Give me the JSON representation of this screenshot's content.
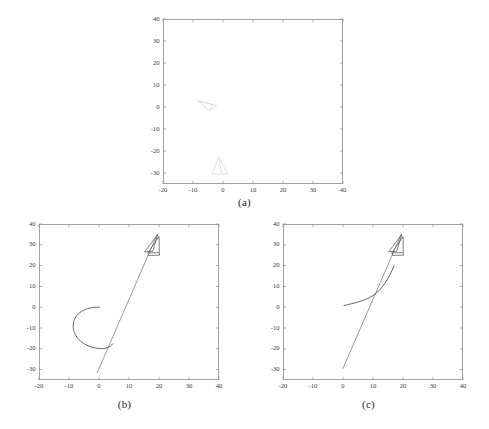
{
  "figure": {
    "panels": [
      {
        "id": "a",
        "caption": "(a)",
        "xlabel": "",
        "ylabel": "",
        "xticks": [
          -20,
          -10,
          0,
          10,
          20,
          30,
          40
        ],
        "yticks": [
          -30,
          -20,
          -10,
          0,
          10,
          20,
          30,
          40
        ],
        "xlim": [
          -20,
          40
        ],
        "ylim": [
          -35,
          40
        ],
        "grid": false,
        "box": true,
        "series": [
          {
            "name": "start-pose-marker",
            "type": "polygon",
            "style": "faint",
            "points": [
              [
                -8.5,
                2.8
              ],
              [
                -2.0,
                0.6
              ],
              [
                -4.4,
                -1.6
              ]
            ]
          },
          {
            "name": "start-pose-marker-inner",
            "type": "polyline",
            "style": "faint",
            "points": [
              [
                -8.5,
                2.8
              ],
              [
                -3.6,
                1.2
              ],
              [
                -4.4,
                -1.6
              ]
            ]
          },
          {
            "name": "goal-pose-marker",
            "type": "polygon",
            "style": "faint",
            "points": [
              [
                -1.5,
                -22.5
              ],
              [
                1.6,
                -30.5
              ],
              [
                -3.6,
                -30.5
              ]
            ]
          },
          {
            "name": "goal-pose-marker-inner",
            "type": "polyline",
            "style": "faint",
            "points": [
              [
                -1.5,
                -22.5
              ],
              [
                -0.4,
                -30.5
              ]
            ]
          }
        ]
      },
      {
        "id": "b",
        "caption": "(b)",
        "xlabel": "",
        "ylabel": "",
        "xticks": [
          -20,
          -10,
          0,
          10,
          20,
          30,
          40
        ],
        "yticks": [
          -30,
          -20,
          -10,
          0,
          10,
          20,
          30,
          40
        ],
        "xlim": [
          -20,
          40
        ],
        "ylim": [
          -35,
          40
        ],
        "grid": false,
        "box": true,
        "series": [
          {
            "name": "straight-path",
            "type": "polyline",
            "style": "line",
            "points": [
              [
                -0.6,
                -31.5
              ],
              [
                19.4,
                35.0
              ]
            ]
          },
          {
            "name": "loop-path",
            "type": "path",
            "style": "curve",
            "d": "M 0.2 0.0 C -4.5 0.3 -8.4 -3.0 -8.6 -8.6 C -8.8 -14.4 -5.0 -19.4 0.4 -19.9 C 2.3 -20.1 3.6 -19.3 4.6 -17.6"
          },
          {
            "name": "robot-triangle-outer",
            "type": "polygon",
            "style": "solid",
            "points": [
              [
                15.2,
                26.6
              ],
              [
                19.6,
                35.0
              ],
              [
                17.9,
                26.9
              ]
            ]
          },
          {
            "name": "robot-triangle-inner",
            "type": "polygon",
            "style": "solid",
            "points": [
              [
                16.3,
                26.1
              ],
              [
                20.0,
                34.0
              ],
              [
                20.1,
                26.2
              ]
            ]
          },
          {
            "name": "robot-base-box",
            "type": "polyline",
            "style": "solid",
            "points": [
              [
                16.3,
                26.1
              ],
              [
                16.5,
                24.9
              ],
              [
                20.2,
                25.0
              ],
              [
                20.1,
                26.2
              ]
            ]
          }
        ]
      },
      {
        "id": "c",
        "caption": "(c)",
        "xlabel": "",
        "ylabel": "",
        "xticks": [
          -20,
          -10,
          0,
          10,
          20,
          30,
          40
        ],
        "yticks": [
          -30,
          -20,
          -10,
          0,
          10,
          20,
          30,
          40
        ],
        "xlim": [
          -20,
          40
        ],
        "ylim": [
          -35,
          40
        ],
        "grid": false,
        "box": true,
        "series": [
          {
            "name": "straight-path",
            "type": "polyline",
            "style": "line",
            "points": [
              [
                0.0,
                -29.4
              ],
              [
                19.4,
                35.0
              ]
            ]
          },
          {
            "name": "smooth-path",
            "type": "path",
            "style": "curve",
            "d": "M 0.3 0.8 C 3.6 1.9 7.2 3.0 10.0 5.6 C 12.9 8.3 15.2 13.6 17.0 19.8"
          },
          {
            "name": "robot-triangle-outer",
            "type": "polygon",
            "style": "solid",
            "points": [
              [
                15.2,
                26.6
              ],
              [
                19.6,
                35.0
              ],
              [
                17.9,
                26.9
              ]
            ]
          },
          {
            "name": "robot-triangle-inner",
            "type": "polygon",
            "style": "solid",
            "points": [
              [
                16.3,
                26.1
              ],
              [
                20.0,
                34.0
              ],
              [
                20.1,
                26.2
              ]
            ]
          },
          {
            "name": "robot-base-box",
            "type": "polyline",
            "style": "solid",
            "points": [
              [
                16.3,
                26.1
              ],
              [
                16.5,
                24.9
              ],
              [
                20.2,
                25.0
              ],
              [
                20.1,
                26.2
              ]
            ]
          }
        ]
      }
    ]
  },
  "chart_data": {
    "type": "line",
    "title": "",
    "subtitle": "",
    "xlabel": "",
    "ylabel": "",
    "xlim": [
      -20,
      40
    ],
    "ylim": [
      -35,
      40
    ],
    "xticks": [
      -20,
      -10,
      0,
      10,
      20,
      30,
      40
    ],
    "yticks": [
      -30,
      -20,
      -10,
      0,
      10,
      20,
      30,
      40
    ],
    "grid": false,
    "legend": "none",
    "panels": [
      {
        "label": "(a)",
        "description": "Initial and goal vehicle poses only; no trajectory drawn",
        "series": [
          {
            "name": "start-pose-marker",
            "x": [
              -8.5,
              -2.0,
              -4.4,
              -8.5
            ],
            "y": [
              2.8,
              0.6,
              -1.6,
              2.8
            ]
          },
          {
            "name": "goal-pose-marker",
            "x": [
              -1.5,
              1.6,
              -3.6,
              -1.5
            ],
            "y": [
              -22.5,
              -30.5,
              -30.5,
              -22.5
            ]
          }
        ]
      },
      {
        "label": "(b)",
        "description": "Trajectory with a looping manoeuvre near the origin followed by a straight run to the goal pose",
        "series": [
          {
            "name": "straight-path",
            "x": [
              -0.6,
              19.4
            ],
            "y": [
              -31.5,
              35.0
            ]
          },
          {
            "name": "loop-path",
            "x": [
              0.2,
              -4.5,
              -8.6,
              -5.0,
              0.4,
              4.6
            ],
            "y": [
              0.0,
              0.3,
              -8.6,
              -19.4,
              -19.9,
              -17.6
            ]
          },
          {
            "name": "goal-pose-marker",
            "x": [
              15.2,
              19.6,
              17.9,
              15.2
            ],
            "y": [
              26.6,
              35.0,
              26.9,
              26.6
            ]
          }
        ]
      },
      {
        "label": "(c)",
        "description": "Smooth trajectory curving from the start pose into the straight run to the goal pose",
        "series": [
          {
            "name": "straight-path",
            "x": [
              0.0,
              19.4
            ],
            "y": [
              -29.4,
              35.0
            ]
          },
          {
            "name": "smooth-path",
            "x": [
              0.3,
              3.6,
              7.2,
              10.0,
              12.9,
              15.2,
              17.0
            ],
            "y": [
              0.8,
              1.9,
              3.0,
              5.6,
              8.3,
              13.6,
              19.8
            ]
          },
          {
            "name": "goal-pose-marker",
            "x": [
              15.2,
              19.6,
              17.9,
              15.2
            ],
            "y": [
              26.6,
              35.0,
              26.9,
              26.6
            ]
          }
        ]
      }
    ]
  }
}
